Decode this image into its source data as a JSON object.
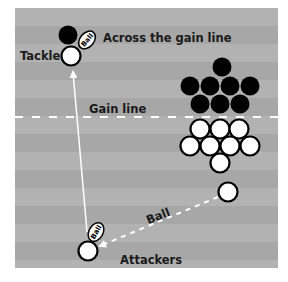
{
  "diagram": {
    "field": {
      "x": 15,
      "y": 8,
      "width": 263,
      "height": 260,
      "stripe_height": 18,
      "stripe_colors": [
        "#b2b2b2",
        "#a7a7a7"
      ]
    },
    "gain_line": {
      "label": "Gain line",
      "y": 117,
      "color": "#ffffff"
    },
    "labels": {
      "across": "Across the gain line",
      "tackle": "Tackle",
      "gain_line": "Gain line",
      "ball_pass": "Ball",
      "attackers": "Attackers",
      "ball_icon_text": "Ball"
    },
    "colors": {
      "text": "#1a1a1a",
      "defender": "#000000",
      "attacker_fill": "#ffffff",
      "attacker_stroke": "#000000",
      "arrow": "#ffffff"
    },
    "defenders": [
      {
        "x": 222,
        "y": 67
      },
      {
        "x": 190,
        "y": 86
      },
      {
        "x": 210,
        "y": 86
      },
      {
        "x": 230,
        "y": 86
      },
      {
        "x": 250,
        "y": 86
      },
      {
        "x": 200,
        "y": 104
      },
      {
        "x": 220,
        "y": 104
      },
      {
        "x": 240,
        "y": 104
      }
    ],
    "attackers_cluster": [
      {
        "x": 200,
        "y": 129
      },
      {
        "x": 220,
        "y": 129
      },
      {
        "x": 239,
        "y": 129
      },
      {
        "x": 190,
        "y": 146
      },
      {
        "x": 210,
        "y": 146
      },
      {
        "x": 230,
        "y": 146
      },
      {
        "x": 250,
        "y": 146
      },
      {
        "x": 220,
        "y": 163
      }
    ],
    "passer": {
      "x": 228,
      "y": 192
    },
    "ball_carrier": {
      "x": 88,
      "y": 251
    },
    "tackle_attacker": {
      "x": 71,
      "y": 56
    },
    "tackle_defender": {
      "x": 68,
      "y": 35
    },
    "ball_top": {
      "x": 87,
      "y": 40,
      "rotate": -50
    },
    "ball_bottom": {
      "x": 96,
      "y": 232,
      "rotate": -60
    },
    "run_arrow": {
      "from": [
        87,
        232
      ],
      "to": [
        73,
        72
      ]
    },
    "pass_arrow": {
      "from": [
        218,
        197
      ],
      "to": [
        100,
        246
      ]
    }
  }
}
